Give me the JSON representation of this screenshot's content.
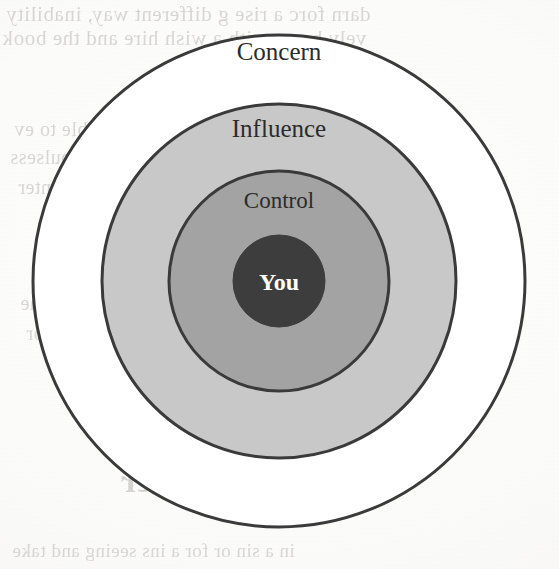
{
  "page": {
    "width": 559,
    "height": 569,
    "background_color": "#fbfbfa",
    "media": "scanned book page"
  },
  "diagram": {
    "name": "circles-of-concern-influence-control",
    "type": "concentric-circles",
    "center": {
      "x": 279,
      "y": 281
    },
    "stroke_color": "#3a3a3a",
    "rings": [
      {
        "id": "concern",
        "label": "Concern",
        "radius": 246,
        "fill": "#ffffff",
        "stroke": "#3a3a3a",
        "stroke_width": 3,
        "label_color": "#2b2b2b",
        "label_x": 279,
        "label_y": 60
      },
      {
        "id": "influence",
        "label": "Influence",
        "radius": 177,
        "fill": "#c8c8c8",
        "stroke": "#3a3a3a",
        "stroke_width": 3,
        "label_color": "#2b2b2b",
        "label_x": 279,
        "label_y": 137
      },
      {
        "id": "control",
        "label": "Control",
        "radius": 110,
        "fill": "#a3a3a3",
        "stroke": "#3a3a3a",
        "stroke_width": 3,
        "label_color": "#2b2b2b",
        "label_x": 279,
        "label_y": 208
      },
      {
        "id": "you",
        "label": "You",
        "radius": 46,
        "fill": "#3d3d3d",
        "stroke": "#3d3d3d",
        "stroke_width": 1,
        "label_color": "#ffffff",
        "label_x": 279,
        "label_y": 290
      }
    ]
  },
  "bleed_through": {
    "note": "faint illegible text showing through from the reverse side of the page",
    "color": "#b9b5b0",
    "lines": [
      "darn forc a rise g different way, inability",
      "vely bases with a wish hire and the book",
      "and unduly as to an issue are remarkable to ev",
      "ntrol your and to the spiral and impulsess",
      "the reaction to was ins and the conter",
      "as to consider to ove the rest of the",
      "ntrol rest in or with a say for",
      "in a sin or for a ins seeing and take"
    ],
    "heading": "nce and Differ"
  }
}
